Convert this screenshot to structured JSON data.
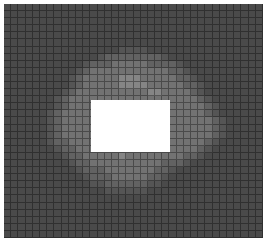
{
  "image": {
    "description": "Pixelated grayscale mosaic with a blurred light blob and a white redaction rectangle in the center",
    "grid": {
      "cols": 36,
      "rows": 33
    },
    "palette": {
      "0": "#4a4a4a",
      "1": "#555555",
      "2": "#626262",
      "3": "#727272",
      "4": "#858585",
      "5": "#999999"
    },
    "rows": [
      "000000000000000000000000000000000000",
      "000000000000000000000000000000000000",
      "000000000000000000000000000000000000",
      "000000000000000000000000000000000000",
      "000000000000000000000000000000000000",
      "000000000000000000000000000000000000",
      "000000000000000011110000000000000000",
      "000000000000012222222210000000000000",
      "000000000001222333332222100000000000",
      "000000000012333333333332210000000000",
      "000000000123333344433333221000000000",
      "000000000123333344443333322100000000",
      "000000001233333333334433332100000000",
      "000000012333333333333333333210000000",
      "000000012333333333333333333321000000",
      "000000123333333333333333333321000000",
      "000000123333333333333333333332100000",
      "000000123333333333333333333332100000",
      "000000123333333333333333333332100000",
      "000000122333333333333333333321000000",
      "000000012233333333333333333210000000",
      "000000001223333343333333322100000000",
      "000000000122333333333322210000000000",
      "000000000012223333333221000000000000",
      "000000000001222333332210000000000000",
      "000000000000112222221100000000000000",
      "000000000000001111110000000000000000",
      "000000000000000000000000000000000000",
      "000000000000000000000000000000000000",
      "000000000000000000000000000000000000",
      "000000000000000000000000000000000000",
      "000000000000000000000000000000000000",
      "000000000000000000000000000000000000"
    ],
    "redaction": {
      "x": 91,
      "y": 100,
      "width": 79,
      "height": 52,
      "color": "#ffffff"
    }
  }
}
